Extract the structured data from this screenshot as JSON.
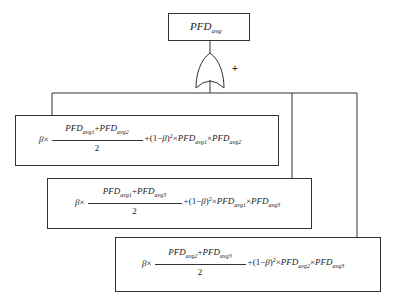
{
  "diagram": {
    "type": "fault-tree",
    "top_event": {
      "label_main": "PFD",
      "label_sub": "avg"
    },
    "gate": {
      "type": "OR",
      "symbol": "+"
    },
    "events": [
      {
        "beta": "β",
        "times": "×",
        "num_a": "PFD",
        "num_a_sub": "avg1",
        "num_plus": "+",
        "num_b": "PFD",
        "num_b_sub": "avg2",
        "den": "2",
        "tail_prefix": "+(1−",
        "tail_beta": "β",
        "tail_close": ")",
        "tail_sq": "2",
        "tail_times1": "×",
        "tail_a": "PFD",
        "tail_a_sub": "avg1",
        "tail_times2": "×",
        "tail_b": "PFD",
        "tail_b_sub": "avg2"
      },
      {
        "beta": "β",
        "times": "×",
        "num_a": "PFD",
        "num_a_sub": "avg1",
        "num_plus": "+",
        "num_b": "PFD",
        "num_b_sub": "avg3",
        "den": "2",
        "tail_prefix": "+(1−",
        "tail_beta": "β",
        "tail_close": ")",
        "tail_sq": "2",
        "tail_times1": "×",
        "tail_a": "PFD",
        "tail_a_sub": "avg1",
        "tail_times2": "×",
        "tail_b": "PFD",
        "tail_b_sub": "avg3"
      },
      {
        "beta": "β",
        "times": "×",
        "num_a": "PFD",
        "num_a_sub": "avg2",
        "num_plus": "+",
        "num_b": "PFD",
        "num_b_sub": "avg3",
        "den": "2",
        "tail_prefix": "+(1−",
        "tail_beta": "β",
        "tail_close": ")",
        "tail_sq": "2",
        "tail_times1": "×",
        "tail_a": "PFD",
        "tail_a_sub": "avg2",
        "tail_times2": "×",
        "tail_b": "PFD",
        "tail_b_sub": "avg3"
      }
    ],
    "colors": {
      "line": "#333333",
      "text": "#1a1a1a",
      "background": "#ffffff"
    }
  }
}
